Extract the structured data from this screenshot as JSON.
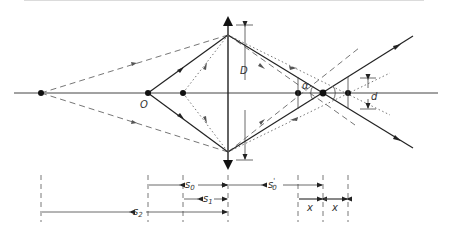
{
  "diagram": {
    "type": "optics-ray-diagram",
    "labels": {
      "object": "O",
      "lens_diameter": "D",
      "angle": "α",
      "spot_diameter": "d"
    },
    "dimensions": {
      "s0": {
        "base": "s",
        "sub": "0",
        "prime": ""
      },
      "s0_prime": {
        "base": "s",
        "sub": "0",
        "prime": "'"
      },
      "s1": {
        "base": "s",
        "sub": "1",
        "prime": ""
      },
      "s2": {
        "base": "s",
        "sub": "2",
        "prime": ""
      },
      "x_left": {
        "base": "x"
      },
      "x_right": {
        "base": "x"
      }
    },
    "colors": {
      "line": "#222222",
      "dashed": "#555555",
      "dotted": "#666666"
    }
  }
}
